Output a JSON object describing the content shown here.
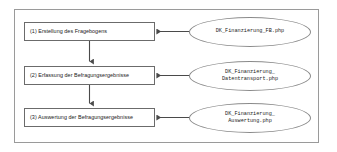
{
  "diagram": {
    "type": "flowchart",
    "frame": {
      "label": "outer-frame"
    },
    "process_steps": [
      {
        "id": "step-1",
        "label": "(1) Erstellung des Fragebogens"
      },
      {
        "id": "step-2",
        "label": "(2) Erfassung der Befragungsergebnisse"
      },
      {
        "id": "step-3",
        "label": "(3) Auswertung der Befragungsergebnisse"
      }
    ],
    "file_nodes": [
      {
        "id": "file-1",
        "lines": [
          "DK_Finanzierung_FB.php"
        ]
      },
      {
        "id": "file-2",
        "lines": [
          "DK_Finanzierung_",
          "Datentransport.php"
        ]
      },
      {
        "id": "file-3",
        "lines": [
          "DK_Finanzierung_",
          "Auswertung.php"
        ]
      }
    ],
    "connectors": [
      {
        "id": "flow-1-to-2",
        "from": "step-1",
        "to": "step-2",
        "direction": "down"
      },
      {
        "id": "flow-2-to-3",
        "from": "step-2",
        "to": "step-3",
        "direction": "down"
      },
      {
        "id": "file-1-to-step-1",
        "from": "file-1",
        "to": "step-1",
        "direction": "left"
      },
      {
        "id": "file-2-to-step-2",
        "from": "file-2",
        "to": "step-2",
        "direction": "left"
      },
      {
        "id": "file-3-to-step-3",
        "from": "file-3",
        "to": "step-3",
        "direction": "left"
      }
    ],
    "colors": {
      "frame_border": "#9a9a9a",
      "box_border": "#6b6b6b",
      "ellipse_border": "#8a8a8a",
      "connector": "#4a4a4a",
      "text": "#1a1a1a",
      "background": "#ffffff"
    }
  }
}
